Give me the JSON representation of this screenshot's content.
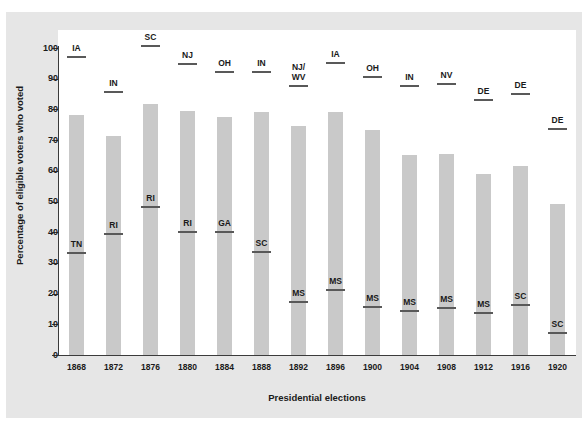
{
  "figure": {
    "background_color": "#e6e6e6",
    "plot_background_color": "#ffffff",
    "bar_color": "#c9c9c9",
    "marker_color": "#595959",
    "axis_color": "#3b3b3b"
  },
  "chart_data": {
    "type": "bar",
    "title": "",
    "xlabel": "Presidential elections",
    "ylabel": "Percentage of eligible voters who voted",
    "ylim": [
      0,
      100
    ],
    "yticks": [
      0,
      10,
      20,
      30,
      40,
      50,
      60,
      70,
      80,
      90,
      100
    ],
    "grid": false,
    "legend": "none",
    "categories": [
      "1868",
      "1872",
      "1876",
      "1880",
      "1884",
      "1888",
      "1892",
      "1896",
      "1900",
      "1904",
      "1908",
      "1912",
      "1916",
      "1920"
    ],
    "values": [
      78.1,
      71.3,
      81.8,
      79.4,
      77.5,
      79.3,
      74.7,
      79.3,
      73.2,
      65.2,
      65.4,
      58.8,
      61.6,
      49.2
    ],
    "series": [
      {
        "name": "National turnout",
        "values": [
          78.1,
          71.3,
          81.8,
          79.4,
          77.5,
          79.3,
          74.7,
          79.3,
          73.2,
          65.2,
          65.4,
          58.8,
          61.6,
          49.2
        ]
      },
      {
        "name": "Highest state turnout",
        "values": [
          97.5,
          86.0,
          101.0,
          95.0,
          92.5,
          92.5,
          88.0,
          95.5,
          91.0,
          88.0,
          88.5,
          83.5,
          85.5,
          74.0
        ],
        "labels": [
          "IA",
          "IN",
          "SC",
          "NJ",
          "OH",
          "IN",
          "NJ/\nWV",
          "IA",
          "OH",
          "IN",
          "NV",
          "DE",
          "DE",
          "DE"
        ]
      },
      {
        "name": "Lowest state turnout",
        "values": [
          33.5,
          39.7,
          48.5,
          40.5,
          40.5,
          34.0,
          17.5,
          21.5,
          16.0,
          14.5,
          15.5,
          14.0,
          16.5,
          7.5
        ],
        "labels": [
          "TN",
          "RI",
          "RI",
          "RI",
          "GA",
          "SC",
          "MS",
          "MS",
          "MS",
          "MS",
          "MS",
          "MS",
          "SC",
          "SC"
        ]
      }
    ]
  }
}
